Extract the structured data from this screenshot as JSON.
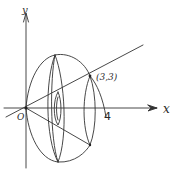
{
  "figure": {
    "type": "solid-of-revolution-sketch",
    "stroke_color": "#333333",
    "background": "#ffffff"
  },
  "labels": {
    "y_axis": "y",
    "x_axis": "x",
    "origin": "O",
    "x_intercept": "4",
    "intersection_point": "(3,3)"
  },
  "axes": {
    "x_axis": {
      "label": "x",
      "arrow": true
    },
    "y_axis": {
      "label": "y",
      "arrow": true
    }
  },
  "curves": [
    {
      "name": "line-y-equals-x",
      "description": "Straight line through origin and (3,3)"
    },
    {
      "name": "mirrored-line",
      "description": "Reflection of the line below the x-axis (revolved image)"
    },
    {
      "name": "outer-surface",
      "description": "Outer boundary of the solid of revolution"
    },
    {
      "name": "cross-section-discs",
      "description": "Elliptical cross-sections showing rotation"
    },
    {
      "name": "bounding-curve",
      "description": "Curve from (3,3) down to x = 4"
    }
  ],
  "points": [
    {
      "label": "O",
      "x": 0,
      "y": 0
    },
    {
      "label": "(3,3)",
      "x": 3,
      "y": 3
    },
    {
      "label": "4",
      "x": 4,
      "y": 0
    }
  ]
}
